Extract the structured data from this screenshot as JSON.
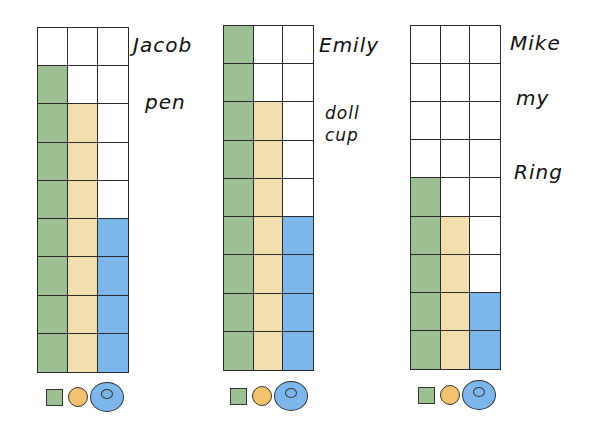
{
  "colors": {
    "green": "#9dbf94",
    "tan": "#f3deb0",
    "blue": "#7db6eb",
    "orange": "#f2c26e",
    "grid_line": "#2a2a2a"
  },
  "legend": [
    {
      "shape": "square-icon",
      "color": "#9dbf94",
      "series": "green"
    },
    {
      "shape": "circle-icon",
      "color": "#f2c26e",
      "series": "tan"
    },
    {
      "shape": "ring-icon",
      "color": "#7db6eb",
      "series": "blue"
    }
  ],
  "panels": [
    {
      "name": "Jacob",
      "words": [
        "pen"
      ],
      "counts": {
        "green": 8,
        "tan": 7,
        "blue": 4
      }
    },
    {
      "name": "Emily",
      "words": [
        "doll",
        "cup"
      ],
      "counts": {
        "green": 9,
        "tan": 7,
        "blue": 4
      }
    },
    {
      "name": "Mike",
      "words": [
        "my",
        "Ring"
      ],
      "counts": {
        "green": 5,
        "tan": 4,
        "blue": 2
      }
    }
  ],
  "chart_data": [
    {
      "type": "bar",
      "title": "Jacob",
      "annotations": [
        "pen"
      ],
      "categories": [
        "square",
        "circle",
        "ring"
      ],
      "values": [
        8,
        7,
        4
      ],
      "ylim": [
        0,
        9
      ],
      "grid": true,
      "grid_rows": 9,
      "grid_cols": 3,
      "legend_position": "bottom",
      "colors": [
        "#9dbf94",
        "#f3deb0",
        "#7db6eb"
      ]
    },
    {
      "type": "bar",
      "title": "Emily",
      "annotations": [
        "doll",
        "cup"
      ],
      "categories": [
        "square",
        "circle",
        "ring"
      ],
      "values": [
        9,
        7,
        4
      ],
      "ylim": [
        0,
        9
      ],
      "grid": true,
      "grid_rows": 9,
      "grid_cols": 3,
      "legend_position": "bottom",
      "colors": [
        "#9dbf94",
        "#f3deb0",
        "#7db6eb"
      ]
    },
    {
      "type": "bar",
      "title": "Mike",
      "annotations": [
        "my",
        "Ring"
      ],
      "categories": [
        "square",
        "circle",
        "ring"
      ],
      "values": [
        5,
        4,
        2
      ],
      "ylim": [
        0,
        9
      ],
      "grid": true,
      "grid_rows": 9,
      "grid_cols": 3,
      "legend_position": "bottom",
      "colors": [
        "#9dbf94",
        "#f3deb0",
        "#7db6eb"
      ]
    }
  ]
}
